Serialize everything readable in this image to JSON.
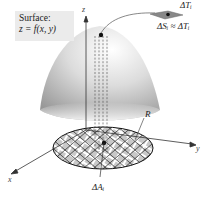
{
  "surface_label": {
    "title": "Surface:",
    "equation": "z = f(x, y)"
  },
  "axes": {
    "x": "x",
    "y": "y",
    "z": "z"
  },
  "labels": {
    "region": "R",
    "delta_T": "ΔTᵢ",
    "delta_S_eq": "ΔSᵢ ≈ ΔTᵢ",
    "delta_A": "ΔAᵢ"
  },
  "colors": {
    "surface_light": "#f2f2f2",
    "surface_dark": "#9a9a9a",
    "region_fill": "#c8c8c8",
    "grid_line": "#222222",
    "label_bg": "#ebebeb"
  }
}
